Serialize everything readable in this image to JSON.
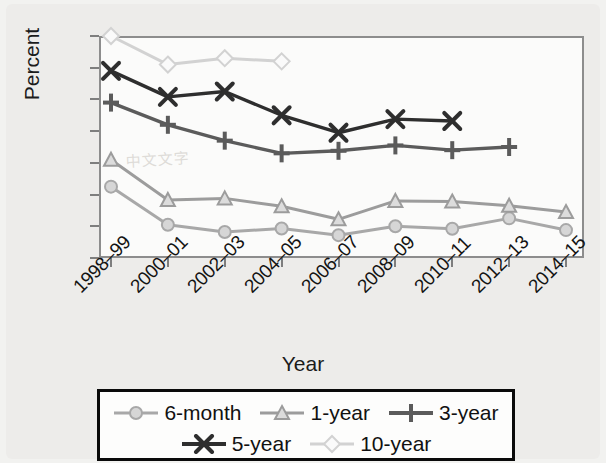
{
  "chart_data": {
    "type": "line",
    "title": "",
    "xlabel": "Year",
    "ylabel": "Percent",
    "ylim": [
      10,
      80
    ],
    "ytick_step": 10,
    "yticks": [
      80,
      70,
      60,
      50,
      40,
      30,
      20,
      10
    ],
    "grid": false,
    "legend_position": "bottom",
    "categories": [
      "1998–99",
      "2000–01",
      "2002–03",
      "2004–05",
      "2006–07",
      "2008–09",
      "2010–11",
      "2012–13",
      "2014–15"
    ],
    "series": [
      {
        "name": "6-month",
        "marker": "circle",
        "color": "#a8a8a8",
        "values": [
          32.5,
          20.5,
          18.2,
          19.3,
          17.2,
          20.0,
          19.2,
          22.5,
          18.8
        ]
      },
      {
        "name": "1-year",
        "marker": "triangle",
        "color": "#9c9c9c",
        "values": [
          41.0,
          28.3,
          28.8,
          26.3,
          22.2,
          28.0,
          27.8,
          26.5,
          24.5
        ]
      },
      {
        "name": "3-year",
        "marker": "plus",
        "color": "#5b5b5b",
        "values": [
          59.0,
          52.0,
          47.0,
          43.0,
          43.8,
          45.5,
          44.0,
          45.0,
          null
        ]
      },
      {
        "name": "5-year",
        "marker": "x",
        "color": "#2e2e2e",
        "values": [
          69.0,
          60.8,
          62.5,
          55.0,
          49.5,
          53.8,
          53.2,
          null,
          null
        ]
      },
      {
        "name": "10-year",
        "marker": "diamond",
        "color": "#d2d2d2",
        "values": [
          80.0,
          71.0,
          73.0,
          72.0,
          null,
          null,
          null,
          null,
          null
        ]
      }
    ]
  },
  "axes": {
    "y_title": "Percent",
    "x_title": "Year",
    "y_labels": [
      "80",
      "70",
      "60",
      "50",
      "40",
      "30",
      "20",
      "10"
    ],
    "x_labels": [
      "1998–99",
      "2000–01",
      "2002–03",
      "2004–05",
      "2006–07",
      "2008–09",
      "2010–11",
      "2012–13",
      "2014–15"
    ]
  },
  "legend": {
    "rows": [
      [
        {
          "label": "6-month",
          "marker": "circle-marker",
          "color": "#a8a8a8"
        },
        {
          "label": "1-year",
          "marker": "triangle-marker",
          "color": "#9c9c9c"
        },
        {
          "label": "3-year",
          "marker": "plus-marker",
          "color": "#5b5b5b"
        }
      ],
      [
        {
          "label": "5-year",
          "marker": "x-marker",
          "color": "#2e2e2e"
        },
        {
          "label": "10-year",
          "marker": "diamond-marker",
          "color": "#d2d2d2"
        }
      ]
    ]
  },
  "watermark": {
    "text": "中文文字"
  }
}
